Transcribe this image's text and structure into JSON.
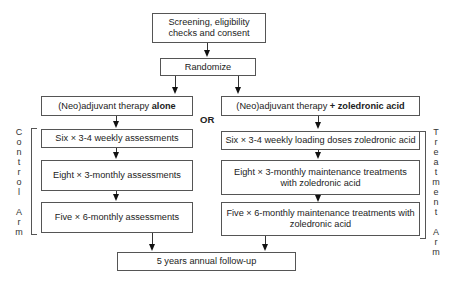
{
  "screening": {
    "label": "Screening, eligibility checks and consent"
  },
  "randomize": {
    "label": "Randomize"
  },
  "or_label": "OR",
  "control_arm": {
    "side_label": "Control Arm",
    "side_label_letters": [
      "C",
      "o",
      "n",
      "t",
      "r",
      "o",
      "l",
      "",
      "A",
      "r",
      "m"
    ],
    "therapy": {
      "prefix": "(Neo)adjuvant therapy ",
      "bold": "alone"
    },
    "steps": [
      "Six × 3-4 weekly assessments",
      "Eight × 3-monthly assessments",
      "Five × 6-monthly assessments"
    ]
  },
  "treatment_arm": {
    "side_label": "Treatment Arm",
    "side_label_letters": [
      "T",
      "r",
      "e",
      "a",
      "t",
      "m",
      "e",
      "n",
      "t",
      "",
      "A",
      "r",
      "m"
    ],
    "therapy": {
      "prefix": "(Neo)adjuvant therapy ",
      "bold": "+ zoledronic acid"
    },
    "steps": [
      "Six × 3-4 weekly loading doses zoledronic acid",
      "Eight × 3-monthly maintenance treatments with zoledronic acid",
      "Five × 6-monthly maintenance treatments with zoledronic acid"
    ]
  },
  "follow_up": {
    "label": "5 years annual follow-up"
  }
}
